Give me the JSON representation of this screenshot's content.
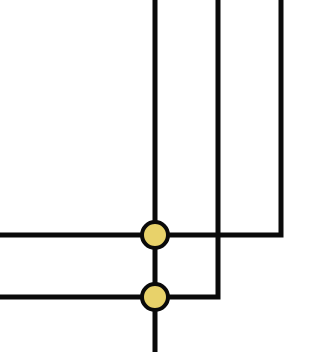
{
  "diagram": {
    "type": "wire-junction-diagram",
    "background": "#ffffff",
    "wire_color": "#0a0a0a",
    "wire_width": 5,
    "node_fill": "#E8D26A",
    "node_stroke": "#0a0a0a",
    "node_stroke_width": 4,
    "node_radius": 13,
    "wires": [
      {
        "name": "vertical-trunk",
        "points": [
          [
            155,
            0
          ],
          [
            155,
            352
          ]
        ]
      },
      {
        "name": "wire-upper-loop",
        "points": [
          [
            0,
            235
          ],
          [
            281,
            235
          ],
          [
            281,
            0
          ]
        ]
      },
      {
        "name": "wire-lower-loop",
        "points": [
          [
            0,
            297
          ],
          [
            218,
            297
          ],
          [
            218,
            0
          ]
        ]
      }
    ],
    "nodes": [
      {
        "name": "junction-upper",
        "cx": 155,
        "cy": 235
      },
      {
        "name": "junction-lower",
        "cx": 155,
        "cy": 297
      }
    ]
  }
}
